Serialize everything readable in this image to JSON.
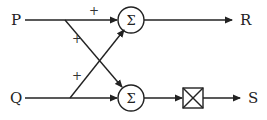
{
  "diagram": {
    "type": "signal-flow / summing-junction block diagram",
    "inputs": [
      {
        "id": "P",
        "label": "P"
      },
      {
        "id": "Q",
        "label": "Q"
      }
    ],
    "outputs": [
      {
        "id": "R",
        "label": "R"
      },
      {
        "id": "S",
        "label": "S"
      }
    ],
    "summers": [
      {
        "id": "sum-top",
        "symbol": "Σ",
        "inputs": [
          "P",
          "Q"
        ],
        "signs": [
          "+",
          "+"
        ],
        "output": "R"
      },
      {
        "id": "sum-bottom",
        "symbol": "Σ",
        "inputs": [
          "P",
          "Q"
        ],
        "signs": [
          "+",
          "+"
        ],
        "output": "multiplier"
      }
    ],
    "blocks": [
      {
        "id": "multiplier",
        "symbol": "crossed-box",
        "input": "sum-bottom",
        "output": "S"
      }
    ],
    "signs": {
      "p_to_top": "+",
      "p_to_bottom": "+",
      "q_to_top": "+"
    },
    "colors": {
      "line": "#222222",
      "background": "#ffffff"
    }
  }
}
